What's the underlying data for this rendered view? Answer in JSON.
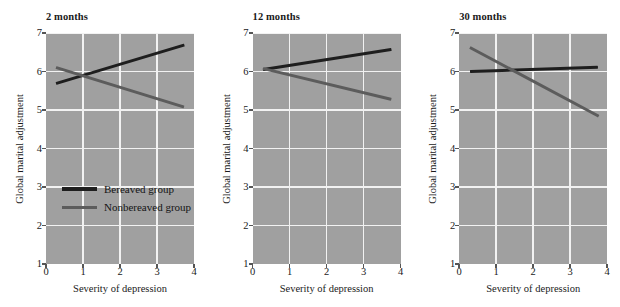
{
  "chart_data": {
    "type": "line",
    "title": "",
    "xlabel": "Severity of depression",
    "ylabel": "Global marital adjustment",
    "xlim": [
      0,
      4
    ],
    "ylim": [
      1,
      7
    ],
    "xticks": [
      0,
      1,
      2,
      3,
      4
    ],
    "yticks": [
      1,
      2,
      3,
      4,
      5,
      6,
      7
    ],
    "grid": true,
    "legend_position": "inside-left-panel",
    "panels": [
      {
        "label": "2 months",
        "series": [
          {
            "name": "Bereaved group",
            "color": "#1e1e1e",
            "x": [
              0.28,
              3.75
            ],
            "y": [
              5.72,
              6.72
            ]
          },
          {
            "name": "Nonbereaved group",
            "color": "#5c5c5c",
            "x": [
              0.28,
              3.75
            ],
            "y": [
              6.15,
              5.12
            ]
          }
        ]
      },
      {
        "label": "12 months",
        "series": [
          {
            "name": "Bereaved group",
            "color": "#1e1e1e",
            "x": [
              0.28,
              3.75
            ],
            "y": [
              6.1,
              6.62
            ]
          },
          {
            "name": "Nonbereaved group",
            "color": "#5c5c5c",
            "x": [
              0.28,
              3.75
            ],
            "y": [
              6.12,
              5.32
            ]
          }
        ]
      },
      {
        "label": "30 months",
        "series": [
          {
            "name": "Bereaved group",
            "color": "#1e1e1e",
            "x": [
              0.28,
              3.75
            ],
            "y": [
              6.05,
              6.16
            ]
          },
          {
            "name": "Nonbereaved group",
            "color": "#5c5c5c",
            "x": [
              0.28,
              3.75
            ],
            "y": [
              6.65,
              4.87
            ]
          }
        ]
      }
    ],
    "legend": [
      {
        "name": "Bereaved group",
        "color": "#1e1e1e"
      },
      {
        "name": "Nonbereaved group",
        "color": "#5c5c5c"
      }
    ],
    "colors": {
      "plot_background": "#a0a0a0",
      "gridline": "#f2f2f2",
      "figure_background": "#ffffff",
      "text": "#1a1a1a"
    }
  }
}
